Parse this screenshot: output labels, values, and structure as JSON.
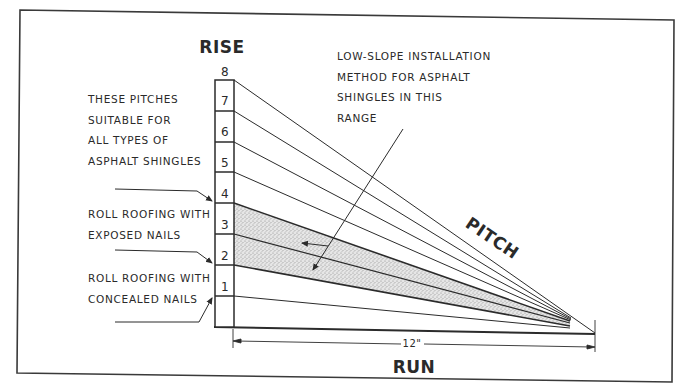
{
  "diagram": {
    "title_vertical_axis": "RISE",
    "title_horizontal_axis": "RUN",
    "slope_label": "PITCH",
    "run_dimension": "12\"",
    "rise_scale": [
      "1",
      "2",
      "3",
      "4",
      "5",
      "6",
      "7",
      "8"
    ],
    "annotations": {
      "all_types": [
        "THESE PITCHES",
        "SUITABLE FOR",
        "ALL TYPES OF",
        "ASPHALT SHINGLES"
      ],
      "exposed_nails": [
        "ROLL ROOFING WITH",
        "EXPOSED NAILS"
      ],
      "concealed_nails": [
        "ROLL ROOFING WITH",
        "CONCEALED NAILS"
      ],
      "low_slope": [
        "LOW-SLOPE INSTALLATION",
        "METHOD FOR ASPHALT",
        "SHINGLES IN THIS",
        "RANGE"
      ]
    },
    "shaded_range": {
      "from_rise": 2,
      "to_rise": 4
    },
    "colors": {
      "ink": "#2b2b2b",
      "shading": "#d9d9d9",
      "background": "#ffffff"
    }
  }
}
